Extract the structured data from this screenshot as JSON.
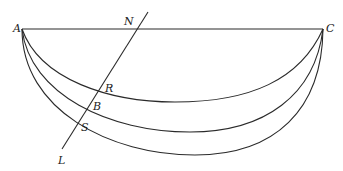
{
  "diagram": {
    "type": "geometric-curves",
    "labels": {
      "A": "A",
      "C": "C",
      "N": "N",
      "R": "R",
      "B": "B",
      "S": "S",
      "L": "L"
    },
    "points": {
      "A": [
        22,
        29
      ],
      "C": [
        323,
        29
      ],
      "N": [
        135,
        29
      ],
      "R": [
        97,
        94
      ],
      "B": [
        86,
        110
      ],
      "S": [
        78,
        122
      ],
      "L": [
        62,
        149
      ],
      "line_top": [
        148,
        12
      ]
    },
    "curves": [
      {
        "name": "inner-curve",
        "through": "R",
        "lowest_y": 102
      },
      {
        "name": "middle-curve",
        "through": "B",
        "lowest_y": 132
      },
      {
        "name": "outer-curve",
        "through": "S",
        "lowest_y": 155
      }
    ],
    "colors": {
      "line": "#2a2a2a",
      "background": "#ffffff"
    }
  }
}
